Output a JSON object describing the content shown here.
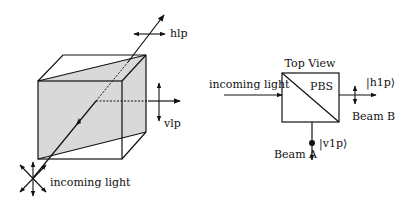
{
  "left_diagram": {
    "beam_label": "incoming light",
    "transmitted_label": "hlp",
    "reflected_label": "vlp",
    "colors": {
      "line": "#111111",
      "plane_fill": "#d9d9d9"
    }
  },
  "right_diagram": {
    "title": "Top View",
    "component_label": "PBS",
    "input_label": "incoming light",
    "beam_b": {
      "label": "Beam B",
      "state": "|h1p⟩"
    },
    "beam_a": {
      "label": "Beam A",
      "state": "|v1p⟩"
    }
  }
}
